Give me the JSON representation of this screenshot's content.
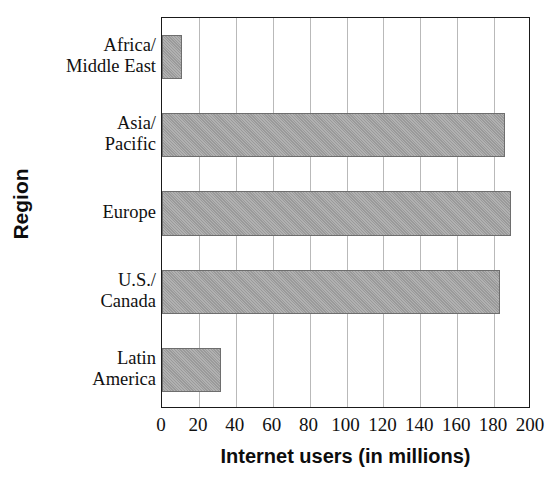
{
  "chart_data": {
    "type": "bar",
    "orientation": "horizontal",
    "title": "",
    "xlabel": "Internet users (in millions)",
    "ylabel": "Region",
    "categories": [
      "Africa/\nMiddle East",
      "Asia/\nPacific",
      "Europe",
      "U.S./\nCanada",
      "Latin\nAmerica"
    ],
    "values": [
      11,
      186,
      189,
      183,
      32
    ],
    "xlim": [
      0,
      200
    ],
    "xticks": [
      0,
      20,
      40,
      60,
      80,
      100,
      120,
      140,
      160,
      180,
      200
    ],
    "xtick_labels": [
      "0",
      "20",
      "40",
      "60",
      "80",
      "100",
      "120",
      "140",
      "160",
      "180",
      "200"
    ],
    "grid": "vertical",
    "legend": "none",
    "bar_color": "#a2a2a2",
    "bar_edge_color": "#6e6e6e",
    "gridline_color": "#b9b9b9",
    "axis_color": "#1a1a1a",
    "background_color": "#ffffff"
  }
}
